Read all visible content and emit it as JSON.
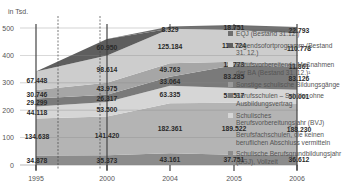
{
  "chart_data": {
    "type": "area",
    "stacked": true,
    "title": "",
    "ylabel": "in Tsd.",
    "xlabel": "",
    "x": [
      "1995",
      "2000",
      "2004",
      "2005",
      "2006"
    ],
    "ylim": [
      0,
      500
    ],
    "yticks": [
      0,
      100,
      200,
      300,
      400,
      500
    ],
    "legend_position": "right",
    "series": [
      {
        "name": "Schulische Berufsgrundbildungsjahr (BGJ), Vollzeit",
        "values": [
          34.878,
          35.373,
          43.161,
          37.751,
          36.612
        ],
        "labels": [
          "34.878",
          "35.373",
          "43.161",
          "37.751",
          "36.612"
        ],
        "color": "#8c8c8c"
      },
      {
        "name": "Berufsfachschulen, die keinen beruflichen Abschluss vermitteln",
        "values": [
          134.638,
          141.42,
          182.361,
          189.522,
          188.23
        ],
        "labels": [
          "134.638",
          "141.420",
          "182.361",
          "189.522",
          "188.230"
        ],
        "color": "#b4b4b4"
      },
      {
        "name": "Schulisches Berufsvorbereitungsjahr (BVJ)",
        "values": [
          44.118,
          53.5,
          63.335,
          53.517,
          50.001
        ],
        "labels": [
          "44.118",
          "53.500",
          "63.335",
          "53.517",
          "50.001"
        ],
        "color": "#d6d6d6"
      },
      {
        "name": "Berufsschulen – Schüler ohne Ausbildungsvertrag",
        "values": [
          29.299,
          26.317,
          33.064,
          83.285,
          83.126
        ],
        "labels": [
          "29.299",
          "26.317",
          "33.064",
          "83.285",
          "83.126"
        ],
        "color": "#7a7a7a"
      },
      {
        "name": "Sonstige schulische Bildungsgänge",
        "values": [
          30.746,
          43.975,
          49.763,
          12.773,
          11.861
        ],
        "labels": [
          "30.746",
          "43.975",
          "49.763",
          "12.773",
          "11.861"
        ],
        "color": "#a6a6a6"
      },
      {
        "name": "Berufsvorbereitende Maßnahmen der BA (Bestand 31. 12.)¹",
        "values": [
          67.448,
          98.614,
          125.184,
          115.724,
          110.778
        ],
        "labels": [
          "67.448",
          "98.614",
          "125.184",
          "115.724",
          "110.778"
        ],
        "color": "#cdcdcd"
      },
      {
        "name": "Jugendsofortprogramm (Bestand 31. 12.)",
        "values": [
          0,
          60.95,
          0,
          0,
          0
        ],
        "labels": [
          "",
          "60.950",
          "",
          "",
          ""
        ],
        "color": "#5e5e5e"
      },
      {
        "name": "EQJ (Bestand 31.12.)",
        "values": [
          0,
          0,
          8.329,
          18.751,
          22.793
        ],
        "labels": [
          "",
          "",
          "8.329",
          "18.751",
          "22.793"
        ],
        "color": "#6e6e6e"
      }
    ]
  },
  "legend": {
    "items": [
      {
        "label": "EQJ (Bestand 31.12.)",
        "color": "#6e6e6e"
      },
      {
        "label": "Jugendsofortprogramm (Bestand 31. 12.)",
        "color": "#5e5e5e"
      },
      {
        "label": "Berufsvorbereitende Maßnahmen der BA (Bestand 31. 12.)¹",
        "color": "#d8d8d8"
      },
      {
        "label": "Sonstige schulische Bildungsgänge",
        "color": "#9a9a9a"
      },
      {
        "label": "Berufsschulen – Schüler ohne Ausbildungsvertrag",
        "color": "#7a7a7a"
      },
      {
        "label": "Schulisches Berufsvorbereitungsjahr (BVJ)",
        "color": "#d6d6d6"
      },
      {
        "label": "Berufsfachschulen, die keinen beruflichen Abschluss vermitteln",
        "color": "#b4b4b4"
      },
      {
        "label": "Schulische Berufsgrundbildungsjahr (BGJ), Vollzeit",
        "color": "#8c8c8c"
      }
    ]
  },
  "axis": {
    "unit_label": "in Tsd."
  }
}
